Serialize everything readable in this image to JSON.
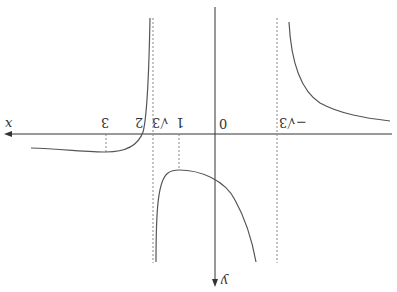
{
  "diagram": {
    "orientation": "rotated-180",
    "axes": {
      "x_label": "x",
      "y_label": "y",
      "origin_label": "0"
    },
    "tick_labels": {
      "one": "1",
      "two": "2",
      "three": "3",
      "sqrt3": "√3",
      "neg_sqrt3": "−√3"
    },
    "asymptotes": [
      "x = √3",
      "x = −√3"
    ],
    "branches": [
      "left-of-−√3 (shown right): decreasing toward axis",
      "between ±√3: arch with max at x = 1",
      "right-of-√3 (shown left): crosses at 2, min at 3"
    ],
    "colors": {
      "curve": "#555555",
      "axis": "#333333",
      "dashed": "#888888"
    }
  }
}
